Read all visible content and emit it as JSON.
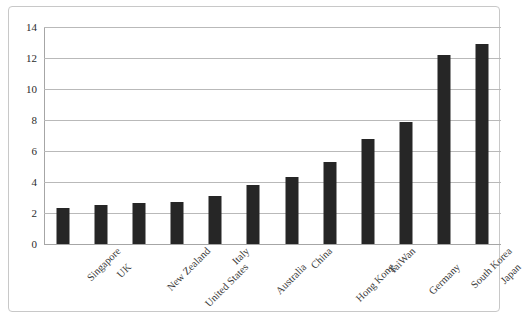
{
  "chart_data": {
    "type": "bar",
    "title": "",
    "subtitle": "",
    "xlabel": "",
    "ylabel": "",
    "ylim": [
      0,
      14
    ],
    "ytick_step": 2,
    "yticks": [
      14,
      12,
      10,
      8,
      6,
      4,
      2,
      0
    ],
    "grid": true,
    "legend": false,
    "legend_position": "none",
    "categories": [
      "Singapore",
      "UK",
      "New  Zealand",
      "United  States",
      "Italy",
      "Australia",
      "China",
      "Hong  Kong",
      "TaiWan",
      "Germany",
      "South  Korea",
      "Japan"
    ],
    "values": [
      2.3,
      2.5,
      2.65,
      2.7,
      3.1,
      3.8,
      4.3,
      5.3,
      6.8,
      7.9,
      12.2,
      12.9
    ],
    "bar_color": "#262626",
    "gridline_color": "#b9b9b9",
    "axis_color": "#a6a6a6",
    "frame_color": "#c8c8c8",
    "label_rotation_deg": -45,
    "label_tiers": [
      0,
      1,
      0,
      1,
      0,
      1,
      0,
      1,
      0,
      1,
      0,
      1
    ]
  }
}
